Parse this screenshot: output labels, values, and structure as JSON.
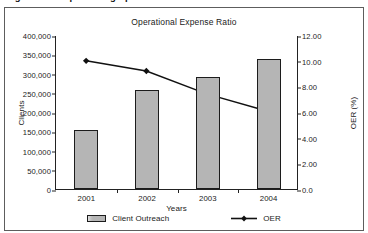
{
  "figure": {
    "caption": "Figure 3. Sample OER graph",
    "frame_color": "#5d5d5d",
    "background": "#ffffff"
  },
  "chart_data": {
    "type": "bar",
    "title": "Operational Expense Ratio",
    "xlabel": "Years",
    "ylabel": "Clients",
    "y2label": "OER (%)",
    "categories": [
      "2001",
      "2002",
      "2003",
      "2004"
    ],
    "grid": false,
    "legend_position": "bottom",
    "ylim": [
      0,
      400000
    ],
    "y2lim": [
      0,
      12
    ],
    "ytick_labels": [
      "0",
      "50,000",
      "100,000",
      "150,000",
      "200,000",
      "250,000",
      "300,000",
      "350,000",
      "400,000"
    ],
    "ytick_values": [
      0,
      50000,
      100000,
      150000,
      200000,
      250000,
      300000,
      350000,
      400000
    ],
    "y2tick_labels": [
      "0.0",
      "2.00",
      "4.00",
      "6.00",
      "8.00",
      "10.00",
      "12.00"
    ],
    "y2tick_values": [
      0,
      2,
      4,
      6,
      8,
      10,
      12
    ],
    "series": [
      {
        "name": "Client Outreach",
        "kind": "bar",
        "axis": "left",
        "color": "#b5b5b5",
        "edge_color": "#1c1c1c",
        "values": [
          153000,
          257000,
          290000,
          338000
        ]
      },
      {
        "name": "OER",
        "kind": "line",
        "axis": "right",
        "color": "#111111",
        "marker": "diamond",
        "values": [
          10.05,
          9.25,
          7.45,
          6.1
        ]
      }
    ]
  },
  "legend": {
    "items": [
      {
        "label": "Client Outreach",
        "marker": "bar-swatch"
      },
      {
        "label": "OER",
        "marker": "line-diamond"
      }
    ]
  }
}
